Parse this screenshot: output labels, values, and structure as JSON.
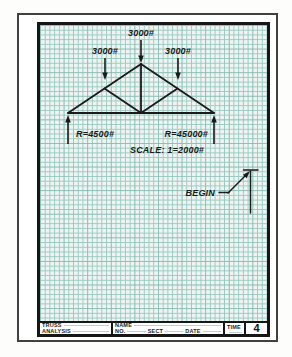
{
  "drawing": {
    "loads": {
      "top": "3000#",
      "left": "3000#",
      "right": "3000#"
    },
    "reactions": {
      "left": "R=4500#",
      "right": "R=45000#"
    },
    "scale_note": "SCALE: 1=2000#",
    "begin_label": "BEGIN"
  },
  "title_block": {
    "title_line1": "TRUSS",
    "title_line2": "ANALYSIS",
    "name_label": "NAME",
    "no_label": "NO.",
    "sect_label": "SECT",
    "date_label": "DATE",
    "time_label": "TIME",
    "sheet_number": "4"
  },
  "colors": {
    "paper": "#eef4f1",
    "grid": "#9ccac3",
    "ink": "#1a1a1a",
    "frame": "#414141"
  }
}
